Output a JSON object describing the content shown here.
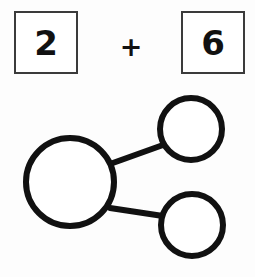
{
  "page": {
    "background_color": "#fdfdfd",
    "width": 255,
    "height": 277
  },
  "equation": {
    "addend_1": "2",
    "operator": "+",
    "addend_2": "6",
    "box_border_color": "#3b3b3b",
    "box_fill_color": "#ffffff",
    "digit_color": "#111111"
  },
  "number_bond": {
    "stroke_color": "#111111",
    "fill_color": "#ffffff",
    "stroke_width": 6,
    "whole_circle": {
      "label": "",
      "cx": 70,
      "cy": 94,
      "r": 44
    },
    "part_circle_top": {
      "label": "",
      "cx": 191,
      "cy": 41,
      "r": 31
    },
    "part_circle_bottom": {
      "label": "",
      "cx": 192,
      "cy": 137,
      "r": 31
    },
    "connector_top": {
      "x1": 110,
      "y1": 76,
      "x2": 163,
      "y2": 57
    },
    "connector_bottom": {
      "x1": 110,
      "y1": 120,
      "x2": 163,
      "y2": 128
    }
  }
}
